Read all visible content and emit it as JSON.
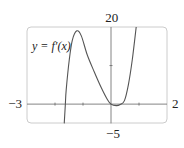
{
  "chart_data": {
    "type": "line",
    "title": "",
    "xlabel": "",
    "ylabel": "",
    "xlim": [
      -3,
      2
    ],
    "ylim": [
      -5,
      20
    ],
    "x_tick_labels": [
      "-3",
      "2"
    ],
    "y_tick_labels": [
      "20",
      "-5"
    ],
    "x_minor_ticks": [
      -2,
      -1,
      1
    ],
    "y_minor_ticks": [
      10
    ],
    "grid": false,
    "annotation": "y = f′(x)",
    "series": [
      {
        "name": "f'(x)",
        "points": [
          [
            -1.67,
            -5.0
          ],
          [
            -1.63,
            0.0
          ],
          [
            -1.6,
            3.7
          ],
          [
            -1.49,
            11.5
          ],
          [
            -1.38,
            16.6
          ],
          [
            -1.22,
            19.0
          ],
          [
            -1.06,
            17.7
          ],
          [
            -0.85,
            12.8
          ],
          [
            -0.6,
            8.4
          ],
          [
            -0.35,
            4.3
          ],
          [
            -0.13,
            1.2
          ],
          [
            0.0,
            0.0
          ],
          [
            0.19,
            -0.4
          ],
          [
            0.33,
            -0.1
          ],
          [
            0.48,
            0.9
          ],
          [
            0.62,
            5.0
          ],
          [
            0.76,
            11.5
          ],
          [
            0.9,
            20.0
          ]
        ]
      }
    ]
  },
  "labels": {
    "x_min": "−3",
    "x_max": "2",
    "y_max": "20",
    "y_min": "−5",
    "function": "y = f′(x)"
  },
  "colors": {
    "curve": "#555555",
    "axis": "#666666",
    "frame": "#cccccc"
  }
}
